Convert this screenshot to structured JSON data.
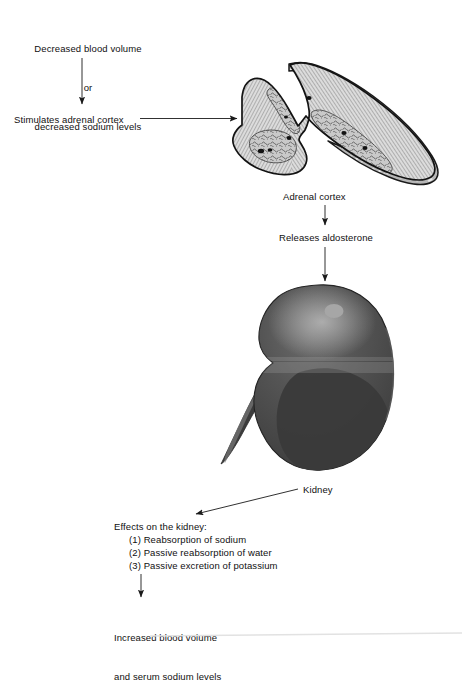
{
  "diagram": {
    "type": "flowchart",
    "background_color": "#ffffff",
    "line_color": "#1a1a1a",
    "text_color": "#101010"
  },
  "steps": {
    "trigger": {
      "line1": "Decreased blood volume",
      "line2": "or",
      "line3": "decreased sodium levels"
    },
    "stimulates": "Stimulates adrenal cortex",
    "adrenal_label": "Adrenal cortex",
    "releases": "Releases aldosterone",
    "kidney_label": "Kidney",
    "effects_heading": "Effects on the kidney:",
    "effects_items": [
      "(1) Reabsorption of sodium",
      "(2) Passive reabsorption of water",
      "(3) Passive excretion of potassium"
    ],
    "outcome": {
      "line1": "Increased blood volume",
      "line2": "and serum sodium levels"
    }
  },
  "illustrations": {
    "adrenal_gland": {
      "name": "adrenal-gland-cross-section",
      "capsule_color": "#b9b9b9",
      "cortex_color": "#d8d8d8",
      "medulla_color": "#c2c2c2",
      "outline_color": "#1a1a1a"
    },
    "kidney": {
      "name": "kidney-organ",
      "body_color": "#4f4f4f",
      "shadow_color": "#3a3a3a",
      "highlight_color": "#9a9a9a",
      "ureter_color": "#3c3c3c",
      "gland_spot_color": "#a8a8a8"
    }
  },
  "arrows": {
    "trigger_to_stimulates": "vertical-arrow",
    "stimulates_to_gland": "horizontal-arrow",
    "gland_to_releases": "vertical-arrow",
    "releases_to_kidney": "vertical-arrow",
    "kidney_label_leader": "diagonal-arrow",
    "effects_to_outcome": "vertical-arrow"
  }
}
